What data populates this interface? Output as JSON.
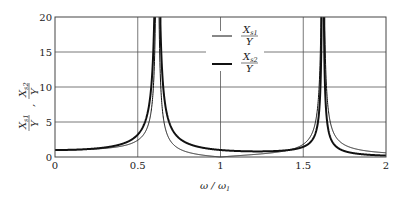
{
  "chart_data": {
    "type": "line",
    "title": "",
    "xlabel": "ω/ω1",
    "ylabel": "X_s1/Y , X_s2/Y",
    "xlim": [
      0,
      2
    ],
    "ylim": [
      0,
      20
    ],
    "xticks": [
      "0",
      "0.5",
      "1",
      "1.5",
      "2"
    ],
    "yticks": [
      "0",
      "5",
      "10",
      "15",
      "20"
    ],
    "grid": true,
    "legend_position": "upper-center-right",
    "resonances": [
      0.618,
      1.618
    ],
    "series": [
      {
        "name": "X_s1/Y",
        "style": "thin",
        "x": [
          0,
          0.1,
          0.2,
          0.3,
          0.4,
          0.5,
          0.55,
          0.6,
          0.65,
          0.7,
          0.8,
          0.9,
          1.0,
          1.1,
          1.2,
          1.3,
          1.4,
          1.5,
          1.55,
          1.6,
          1.65,
          1.7,
          1.8,
          1.9,
          2.0
        ],
        "values": [
          1.0,
          1.02,
          1.1,
          1.25,
          1.55,
          2.4,
          3.7,
          14.1,
          6.2,
          2.0,
          0.67,
          0.25,
          0.0,
          0.2,
          0.38,
          0.6,
          0.93,
          1.82,
          3.5,
          18.9,
          11.7,
          4.3,
          1.37,
          0.87,
          0.6
        ]
      },
      {
        "name": "X_s2/Y",
        "style": "thick",
        "x": [
          0,
          0.1,
          0.2,
          0.3,
          0.4,
          0.5,
          0.55,
          0.6,
          0.65,
          0.7,
          0.8,
          0.9,
          1.0,
          1.1,
          1.2,
          1.3,
          1.4,
          1.5,
          1.55,
          1.6,
          1.65,
          1.7,
          1.8,
          1.9,
          2.0
        ],
        "values": [
          1.0,
          1.03,
          1.14,
          1.37,
          1.85,
          3.2,
          5.4,
          21.9,
          10.7,
          3.9,
          1.87,
          1.32,
          1.0,
          0.96,
          0.86,
          0.87,
          0.95,
          1.45,
          2.4,
          11.6,
          7.4,
          2.8,
          0.81,
          0.48,
          0.2
        ]
      }
    ]
  },
  "legend": {
    "s1": {
      "num": "X",
      "sub": "s1",
      "den": "Y"
    },
    "s2": {
      "num": "X",
      "sub": "s2",
      "den": "Y"
    }
  },
  "axis": {
    "xlabel_main": "ω / ω",
    "xlabel_sub": "1",
    "ylabel_a_num": "X",
    "ylabel_a_sub": "s1",
    "ylabel_a_den": "Y",
    "ylabel_b_num": "X",
    "ylabel_b_sub": "s2",
    "ylabel_b_den": "Y",
    "ylabel_sep": ","
  }
}
